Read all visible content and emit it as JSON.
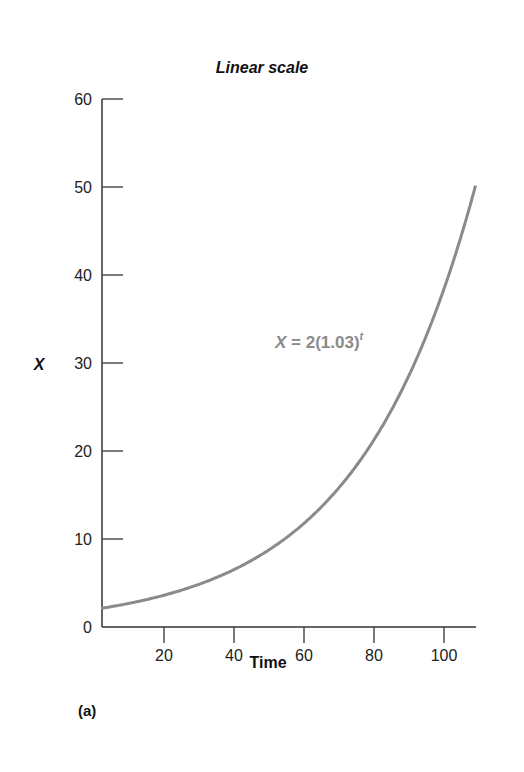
{
  "chart_data": {
    "type": "line",
    "title": "Linear scale",
    "xlabel": "Time",
    "ylabel": "X",
    "panel_label": "(a)",
    "annotation": {
      "text_prefix": "X = 2(1.03)",
      "superscript": "t"
    },
    "xlim": [
      2,
      109
    ],
    "ylim": [
      0,
      60
    ],
    "xticks": [
      20,
      40,
      60,
      80,
      100
    ],
    "yticks": [
      0,
      10,
      20,
      30,
      40,
      50,
      60
    ],
    "grid": false,
    "series": [
      {
        "name": "X = 2(1.03)^t",
        "color": "#8a8a8a",
        "formula": "2*1.03^t",
        "x": [
          2,
          10,
          20,
          30,
          40,
          50,
          60,
          70,
          80,
          90,
          100,
          109
        ],
        "values": [
          2.12,
          2.69,
          3.61,
          4.85,
          6.52,
          8.77,
          11.78,
          15.84,
          21.28,
          28.6,
          38.44,
          50.2
        ]
      }
    ]
  }
}
